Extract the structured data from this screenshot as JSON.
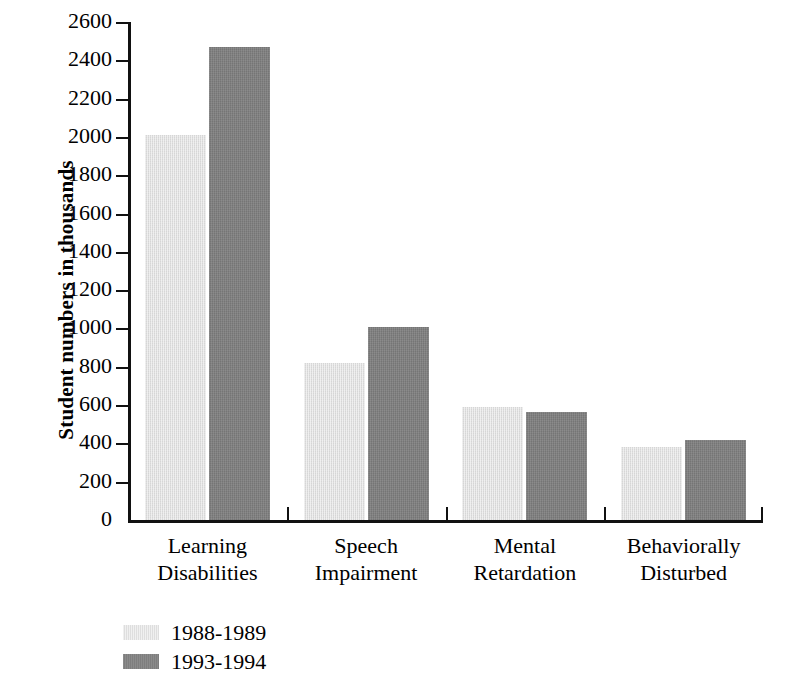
{
  "chart_data": {
    "type": "bar",
    "title": "",
    "subtitle": "",
    "xlabel": "",
    "ylabel": "Student numbers in thousands",
    "ylim": [
      0,
      2600
    ],
    "ytick_step": 200,
    "yticks": [
      0,
      200,
      400,
      600,
      800,
      1000,
      1200,
      1400,
      1600,
      1800,
      2000,
      2200,
      2400,
      2600
    ],
    "ytick_labels": [
      "0",
      "200",
      "400",
      "600",
      "800",
      "1000",
      "1200",
      "1400",
      "1600",
      "1800",
      "2000",
      "2200",
      "2400",
      "2600"
    ],
    "grid": false,
    "legend_position": "bottom-left",
    "categories": [
      "Learning Disabilities",
      "Speech Impairment",
      "Mental Retardation",
      "Behaviorally Disturbed"
    ],
    "category_lines": [
      [
        "Learning",
        "Disabilities"
      ],
      [
        "Speech",
        "Impairment"
      ],
      [
        "Mental",
        "Retardation"
      ],
      [
        "Behaviorally",
        "Disturbed"
      ]
    ],
    "series": [
      {
        "name": "1988-1989",
        "color": "#dedede",
        "values": [
          2010,
          820,
          590,
          380
        ]
      },
      {
        "name": "1993-1994",
        "color": "#7e7e7e",
        "values": [
          2470,
          1010,
          565,
          420
        ]
      }
    ]
  },
  "legend": {
    "items": [
      {
        "label": "1988-1989",
        "color": "#dedede"
      },
      {
        "label": "1993-1994",
        "color": "#7e7e7e"
      }
    ]
  },
  "axis": {
    "y_label": "Student numbers in thousands"
  },
  "colors": {
    "series_1988_1989": "#dedede",
    "series_1993_1994": "#7e7e7e",
    "axis": "#111111",
    "background": "#ffffff"
  }
}
